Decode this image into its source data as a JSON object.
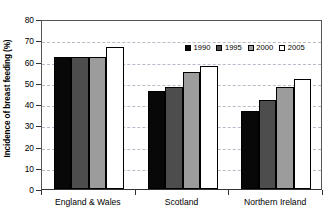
{
  "chart_data": {
    "type": "bar",
    "title": "",
    "xlabel": "",
    "ylabel": "Incidence of breast feeding (%)",
    "categories": [
      "England & Wales",
      "Scotland",
      "Northern Ireland"
    ],
    "series": [
      {
        "name": "1990",
        "color": "#080808",
        "values": [
          62,
          46,
          36.5
        ]
      },
      {
        "name": "1995",
        "color": "#4d4d4d",
        "values": [
          62,
          48,
          42
        ]
      },
      {
        "name": "2000",
        "color": "#9c9c9c",
        "values": [
          62,
          55,
          48
        ]
      },
      {
        "name": "2005",
        "color": "#ffffff",
        "values": [
          67,
          58,
          52
        ]
      }
    ],
    "ylim": [
      0,
      80
    ],
    "ytick_values": [
      0,
      10,
      20,
      30,
      40,
      50,
      60,
      70,
      80
    ],
    "ytick_labels": [
      "0",
      "10",
      "20",
      "30",
      "40",
      "50",
      "60",
      "70",
      "80"
    ],
    "grid": "horizontal-dashed",
    "legend_position": "upper-center-right",
    "legend_entries": [
      "1990",
      "1995",
      "2000",
      "2005"
    ]
  }
}
